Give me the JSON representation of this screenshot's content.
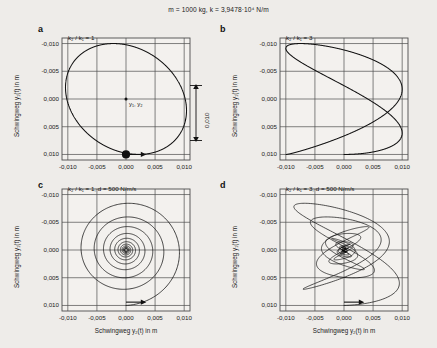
{
  "figure": {
    "caption": "m = 1000 kg,  k = 3,9478·10⁴ N/m",
    "background_color": "#eeece9",
    "line_color": "#111111",
    "grid_color": "#4d4d4d"
  },
  "axes": {
    "x_label": "Schwingweg y₂(t) in m",
    "y_label": "Schwingweg y₁(t) in m",
    "x_ticks": [
      "-0,010",
      "-0,005",
      "0,000",
      "0,005",
      "0,010"
    ],
    "y_ticks": [
      "-0,010",
      "-0,005",
      "0,000",
      "0,005",
      "0,010"
    ],
    "x_values": [
      -0.01,
      -0.005,
      0.0,
      0.005,
      0.01
    ],
    "y_values": [
      -0.01,
      -0.005,
      0.0,
      0.005,
      0.01
    ],
    "y_axis_inverted": true,
    "scale_bar_label": "0,010"
  },
  "panels": [
    {
      "letter": "a",
      "annotation": "k₂ / k₁ = 1",
      "point_label": "y₁, y₂",
      "has_start_dot": true,
      "has_direction_arrow": true,
      "show_y_ticks": true,
      "show_x_ticks": true,
      "show_y_label": true,
      "show_x_label": false
    },
    {
      "letter": "b",
      "annotation": "k₂ / k₁ = 3",
      "point_label": "",
      "has_start_dot": false,
      "has_direction_arrow": false,
      "show_y_ticks": true,
      "show_x_ticks": true,
      "show_y_label": true,
      "show_x_label": false
    },
    {
      "letter": "c",
      "annotation": "k₂ / k₁ = 1,  d = 500 N/m/s",
      "point_label": "",
      "has_start_dot": false,
      "has_direction_arrow": true,
      "show_y_ticks": true,
      "show_x_ticks": true,
      "show_y_label": true,
      "show_x_label": true
    },
    {
      "letter": "d",
      "annotation": "k₂ / k₁ = 3,  d = 500 N/m/s",
      "point_label": "",
      "has_start_dot": false,
      "has_direction_arrow": true,
      "show_y_ticks": true,
      "show_x_ticks": true,
      "show_y_label": true,
      "show_x_label": true
    }
  ],
  "chart_data": {
    "type": "line",
    "title": "m = 1000 kg,  k = 3,9478·10⁴ N/m",
    "xlabel": "Schwingweg y₂(t) in m",
    "ylabel": "Schwingweg y₁(t) in m",
    "xlim": [
      -0.011,
      0.011
    ],
    "ylim": [
      -0.011,
      0.011
    ],
    "y_inverted": true,
    "grid": true,
    "legend": "none",
    "subplots": [
      {
        "id": "a",
        "label": "k₂ / k₁ = 1",
        "curve": "lissajous",
        "freq_ratio_y2_over_y1": 1.0,
        "amplitude_x": 0.0104,
        "amplitude_y": 0.01,
        "phase_deg": 78,
        "damping": 0.0,
        "turns": 1,
        "start_point": [
          0.0,
          0.01
        ],
        "annotations": [
          {
            "text": "y₁, y₂",
            "at": [
              0.0006,
              0.0008
            ]
          }
        ]
      },
      {
        "id": "b",
        "label": "k₂ / k₁ = 3",
        "curve": "lissajous",
        "freq_ratio_y2_over_y1": 1.732,
        "amplitude_x": 0.01,
        "amplitude_y": 0.01,
        "phase_deg": 90,
        "damping": 0.0,
        "turns": 1
      },
      {
        "id": "c",
        "label": "k₂ / k₁ = 1,  d = 500 N/m/s",
        "curve": "damped-spiral",
        "freq_ratio_y2_over_y1": 1.0,
        "amplitude_x": 0.01,
        "amplitude_y": 0.01,
        "phase_deg": 90,
        "damping": 0.055,
        "turns": 11,
        "start_point": [
          0.0,
          0.01
        ]
      },
      {
        "id": "d",
        "label": "k₂ / k₁ = 3,  d = 500 N/m/s",
        "curve": "damped-lissajous",
        "freq_ratio_y2_over_y1": 1.732,
        "amplitude_x": 0.01,
        "amplitude_y": 0.01,
        "phase_deg": 90,
        "damping": 0.055,
        "turns": 11,
        "start_point": [
          0.0,
          0.01
        ]
      }
    ]
  }
}
